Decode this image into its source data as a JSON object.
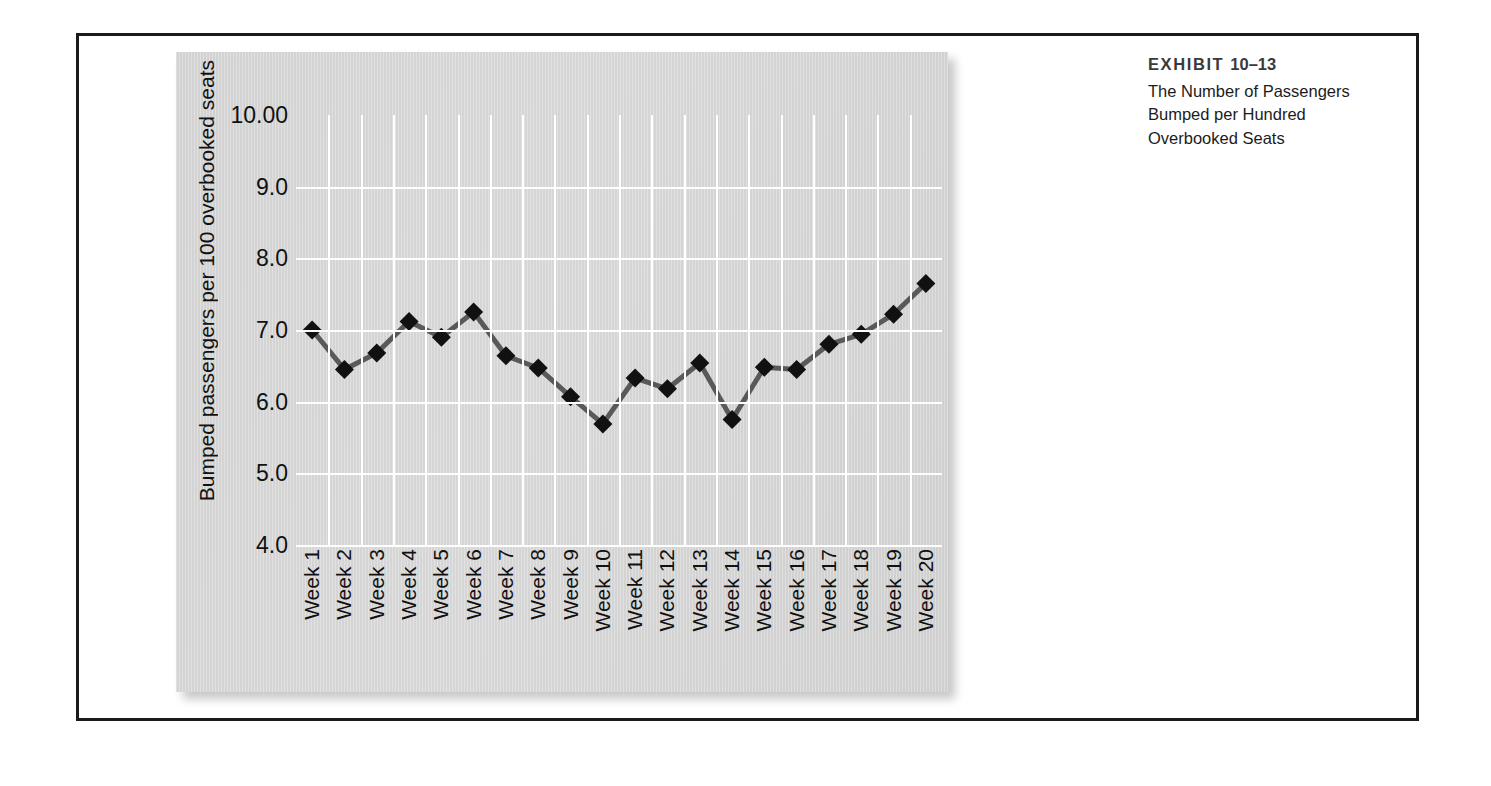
{
  "caption": {
    "label": "EXHIBIT",
    "number": "10–13",
    "line1": "The Number of Passengers",
    "line2": "Bumped per Hundred",
    "line3": "Overbooked Seats"
  },
  "colors": {
    "panel_background": "#d3d3d3",
    "gridline": "#ffffff",
    "series_line": "#595959",
    "marker": "#111111",
    "frame_border": "#1a1a1a",
    "text": "#111111",
    "caption_title": "#3a3a3a"
  },
  "chart_data": {
    "type": "line",
    "title": "",
    "xlabel": "",
    "ylabel": "Bumped passengers per 100 overbooked seats",
    "ylim": [
      4.0,
      10.0
    ],
    "ytick_labels": [
      "10.00",
      "9.0",
      "8.0",
      "7.0",
      "6.0",
      "5.0",
      "4.0"
    ],
    "ytick_values": [
      10.0,
      9.0,
      8.0,
      7.0,
      6.0,
      5.0,
      4.0
    ],
    "grid": true,
    "legend": "none",
    "categories": [
      "Week 1",
      "Week 2",
      "Week 3",
      "Week 4",
      "Week 5",
      "Week 6",
      "Week 7",
      "Week 8",
      "Week 9",
      "Week 10",
      "Week 11",
      "Week 12",
      "Week 13",
      "Week 14",
      "Week 15",
      "Week 16",
      "Week 17",
      "Week 18",
      "Week 19",
      "Week 20"
    ],
    "series": [
      {
        "name": "Bumped passengers per 100 overbooked seats",
        "marker": "diamond",
        "values": [
          7.0,
          6.45,
          6.68,
          7.12,
          6.9,
          7.25,
          6.64,
          6.47,
          6.07,
          5.69,
          6.33,
          6.18,
          6.54,
          5.75,
          6.48,
          6.45,
          6.8,
          6.94,
          7.22,
          7.65
        ]
      }
    ]
  }
}
